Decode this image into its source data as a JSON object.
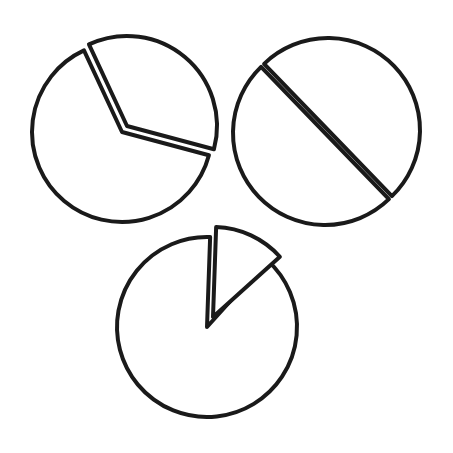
{
  "diagram": {
    "title": "",
    "background": "#ffffff",
    "ink_color": "#1a1a1a",
    "pies": [
      {
        "id": "pie-top-left",
        "center": [
          122,
          132
        ],
        "radius": 90,
        "slices": [
          {
            "label": "",
            "fraction": 0.64,
            "start_deg": 15,
            "end_deg": 245,
            "exploded": false
          },
          {
            "label": "",
            "fraction": 0.36,
            "start_deg": 245,
            "end_deg": 375,
            "exploded": true,
            "offset": [
              5,
              -6
            ]
          }
        ]
      },
      {
        "id": "pie-top-right",
        "center": [
          325,
          133
        ],
        "radius": 92,
        "slices": [
          {
            "label": "",
            "fraction": 0.5,
            "start_deg": 46,
            "end_deg": 226,
            "exploded": false
          },
          {
            "label": "",
            "fraction": 0.5,
            "start_deg": 226,
            "end_deg": 406,
            "exploded": true,
            "offset": [
              3,
              -3
            ]
          }
        ]
      },
      {
        "id": "pie-bottom",
        "center": [
          207,
          327
        ],
        "radius": 90,
        "slices": [
          {
            "label": "",
            "fraction": 0.86,
            "start_deg": 312,
            "end_deg": 632,
            "exploded": false
          },
          {
            "label": "",
            "fraction": 0.14,
            "start_deg": 272,
            "end_deg": 318,
            "exploded": true,
            "offset": [
              6,
              -10
            ]
          }
        ]
      }
    ]
  }
}
